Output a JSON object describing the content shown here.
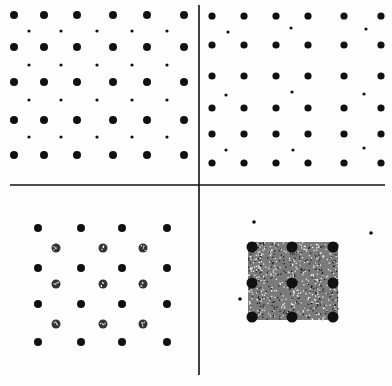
{
  "figure": {
    "title": "Four-panel dot lattice patterns",
    "ink_color": "#111111",
    "paper_color": "#fdfdfd",
    "dividers": {
      "horizontal": {
        "x1": 10,
        "x2": 385,
        "y": 185
      },
      "vertical": {
        "x": 199,
        "y1": 5,
        "y2": 375
      }
    },
    "panels": [
      {
        "id": "top-left",
        "description": "Rectangular lattice of large dots with small dots at cell centers",
        "large_dots": {
          "xs": [
            14,
            44,
            77,
            113,
            147,
            184
          ],
          "ys": [
            15,
            47,
            82,
            120,
            155
          ],
          "r": 4
        },
        "small_dots": {
          "xs": [
            29,
            61,
            97,
            132,
            167
          ],
          "ys": [
            31,
            65,
            100,
            137
          ],
          "r": 1.6
        }
      },
      {
        "id": "top-right",
        "description": "Square lattice of dots with sparse small interstitial dots",
        "large_dots": {
          "xs": [
            212,
            244,
            276,
            308,
            344,
            381
          ],
          "ys": [
            16,
            45,
            76,
            108,
            134,
            163
          ],
          "r": 3.6
        },
        "small_dots": [
          [
            228,
            32
          ],
          [
            291,
            28
          ],
          [
            366,
            29
          ],
          [
            226,
            95
          ],
          [
            292,
            92
          ],
          [
            364,
            94
          ],
          [
            226,
            150
          ],
          [
            293,
            150
          ],
          [
            364,
            148
          ]
        ],
        "small_r": 1.6
      },
      {
        "id": "bottom-left",
        "description": "Solid dot lattice with speckled dots at cell centers",
        "large_dots": {
          "xs": [
            38,
            81,
            122,
            167
          ],
          "ys": [
            228,
            268,
            304,
            342
          ],
          "r": 4
        },
        "speckled_dots": {
          "xs": [
            56,
            103,
            143
          ],
          "ys": [
            248,
            284,
            324
          ],
          "r": 4.5
        }
      },
      {
        "id": "bottom-right",
        "description": "Dense speckled square with 3x3 large dots",
        "square": {
          "x": 248,
          "y": 242,
          "w": 90,
          "h": 78
        },
        "large_dots": {
          "xs": [
            252,
            292,
            333
          ],
          "ys": [
            247,
            283,
            317
          ],
          "r": 5.5
        },
        "stray_dots": [
          [
            254,
            222
          ],
          [
            371,
            233
          ],
          [
            240,
            299
          ]
        ]
      }
    ]
  }
}
